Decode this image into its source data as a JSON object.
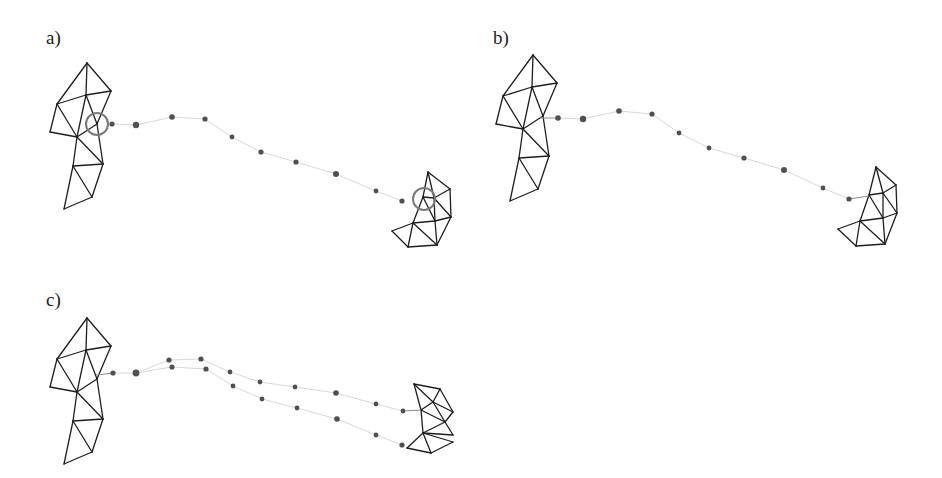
{
  "figure": {
    "panels": [
      {
        "id": "a",
        "label": "a)",
        "label_pos": [
          46,
          28
        ],
        "description": "Two triangle meshes with highlighted contact circles and a dotted trajectory between them",
        "left_mesh_offset": [
          0,
          0
        ],
        "right_mesh": {
          "vertices": [
            [
              428,
              172
            ],
            [
              450,
              189
            ],
            [
              423,
              197
            ],
            [
              434,
              198
            ],
            [
              451,
              217
            ],
            [
              435,
              221
            ],
            [
              413,
              223
            ],
            [
              392,
              231
            ],
            [
              408,
              247
            ],
            [
              437,
              245
            ]
          ],
          "edges": [
            [
              0,
              1
            ],
            [
              0,
              2
            ],
            [
              0,
              3
            ],
            [
              1,
              3
            ],
            [
              2,
              3
            ],
            [
              3,
              4
            ],
            [
              1,
              4
            ],
            [
              2,
              5
            ],
            [
              3,
              5
            ],
            [
              2,
              6
            ],
            [
              4,
              5
            ],
            [
              5,
              6
            ],
            [
              6,
              7
            ],
            [
              7,
              8
            ],
            [
              6,
              8
            ],
            [
              6,
              9
            ],
            [
              5,
              9
            ],
            [
              4,
              9
            ],
            [
              8,
              9
            ]
          ]
        },
        "dots": [
          [
            112,
            124
          ],
          [
            136,
            125
          ],
          [
            172,
            117
          ],
          [
            205,
            119
          ],
          [
            232,
            137
          ],
          [
            261,
            152
          ],
          [
            296,
            162
          ],
          [
            336,
            174
          ],
          [
            376,
            191
          ],
          [
            402,
            201
          ]
        ],
        "dot_radius": [
          2.6,
          3.2,
          2.8,
          2.6,
          2.4,
          2.6,
          2.6,
          3.0,
          2.4,
          2.6
        ],
        "highlight_circles": [
          [
            97,
            124,
            11
          ],
          [
            424,
            199,
            11
          ]
        ],
        "attach_lines": []
      },
      {
        "id": "b",
        "label": "b)",
        "label_pos": [
          493,
          28
        ],
        "description": "Meshes connected by a dotted trajectory with attachment segments",
        "left_mesh_offset": [
          446,
          -8
        ],
        "right_mesh": {
          "vertices": [
            [
              876,
              167
            ],
            [
              896,
              185
            ],
            [
              883,
              193
            ],
            [
              869,
              195
            ],
            [
              897,
              213
            ],
            [
              883,
              218
            ],
            [
              860,
              221
            ],
            [
              838,
              229
            ],
            [
              856,
              246
            ],
            [
              885,
              244
            ]
          ],
          "edges": [
            [
              0,
              1
            ],
            [
              0,
              3
            ],
            [
              0,
              2
            ],
            [
              1,
              2
            ],
            [
              3,
              2
            ],
            [
              2,
              4
            ],
            [
              1,
              4
            ],
            [
              3,
              5
            ],
            [
              2,
              5
            ],
            [
              3,
              6
            ],
            [
              4,
              5
            ],
            [
              5,
              6
            ],
            [
              6,
              7
            ],
            [
              7,
              8
            ],
            [
              6,
              8
            ],
            [
              6,
              9
            ],
            [
              5,
              9
            ],
            [
              4,
              9
            ],
            [
              8,
              9
            ]
          ]
        },
        "dots": [
          [
            558,
            118
          ],
          [
            583,
            119
          ],
          [
            619,
            111
          ],
          [
            652,
            114
          ],
          [
            679,
            133
          ],
          [
            709,
            148
          ],
          [
            744,
            158
          ],
          [
            784,
            170
          ],
          [
            823,
            188
          ],
          [
            849,
            199
          ]
        ],
        "dot_radius": [
          2.8,
          3.2,
          2.8,
          2.6,
          2.4,
          2.4,
          2.6,
          3.0,
          2.4,
          2.6
        ],
        "highlight_circles": [],
        "attach_lines": [
          [
            540,
            118,
            558,
            118
          ],
          [
            849,
            199,
            869,
            196
          ]
        ]
      },
      {
        "id": "c",
        "label": "c)",
        "label_pos": [
          46,
          290
        ],
        "description": "Meshes connected by a trajectory that splits into two branches",
        "left_mesh_offset": [
          0,
          255
        ],
        "right_mesh": {
          "vertices": [
            [
              414,
              384
            ],
            [
              440,
              389
            ],
            [
              453,
              412
            ],
            [
              433,
              402
            ],
            [
              421,
              410
            ],
            [
              445,
              422
            ],
            [
              423,
              433
            ],
            [
              453,
              435
            ],
            [
              453,
              442
            ],
            [
              407,
              448
            ],
            [
              431,
              453
            ]
          ],
          "edges": [
            [
              0,
              1
            ],
            [
              1,
              2
            ],
            [
              0,
              3
            ],
            [
              0,
              4
            ],
            [
              1,
              3
            ],
            [
              3,
              4
            ],
            [
              3,
              2
            ],
            [
              3,
              5
            ],
            [
              2,
              5
            ],
            [
              4,
              5
            ],
            [
              4,
              6
            ],
            [
              5,
              6
            ],
            [
              5,
              7
            ],
            [
              6,
              7
            ],
            [
              6,
              8
            ],
            [
              6,
              9
            ],
            [
              9,
              10
            ],
            [
              6,
              10
            ],
            [
              10,
              8
            ]
          ]
        },
        "dots": [
          [
            113,
            373
          ],
          [
            136,
            373
          ],
          [
            169,
            360
          ],
          [
            201,
            359
          ],
          [
            230,
            372
          ],
          [
            260,
            382
          ],
          [
            295,
            387
          ],
          [
            336,
            393
          ],
          [
            376,
            404
          ],
          [
            403,
            411
          ],
          [
            172,
            367
          ],
          [
            206,
            369
          ],
          [
            233,
            386
          ],
          [
            262,
            399
          ],
          [
            297,
            408
          ],
          [
            337,
            419
          ],
          [
            376,
            435
          ],
          [
            402,
            445
          ]
        ],
        "dot_radius": [
          2.6,
          3.4,
          2.6,
          2.6,
          2.4,
          2.4,
          2.4,
          2.8,
          2.4,
          2.4,
          2.6,
          2.6,
          2.4,
          2.4,
          2.4,
          2.8,
          2.4,
          2.6
        ],
        "highlight_circles": [],
        "attach_lines": [
          [
            96,
            375,
            113,
            373
          ],
          [
            403,
            411,
            421,
            410
          ]
        ]
      }
    ],
    "left_mesh_base": {
      "vertices": [
        [
          87,
          63
        ],
        [
          111,
          91
        ],
        [
          57,
          104
        ],
        [
          86,
          95
        ],
        [
          50,
          132
        ],
        [
          77,
          137
        ],
        [
          97,
          124
        ],
        [
          103,
          164
        ],
        [
          73,
          166
        ],
        [
          92,
          197
        ],
        [
          64,
          209
        ]
      ],
      "edges": [
        [
          0,
          1
        ],
        [
          0,
          2
        ],
        [
          0,
          3
        ],
        [
          3,
          1
        ],
        [
          3,
          2
        ],
        [
          2,
          4
        ],
        [
          2,
          5
        ],
        [
          3,
          5
        ],
        [
          3,
          6
        ],
        [
          1,
          6
        ],
        [
          4,
          5
        ],
        [
          5,
          6
        ],
        [
          6,
          7
        ],
        [
          5,
          7
        ],
        [
          5,
          8
        ],
        [
          8,
          7
        ],
        [
          8,
          9
        ],
        [
          7,
          9
        ],
        [
          8,
          10
        ],
        [
          9,
          10
        ]
      ]
    },
    "colors": {
      "mesh_stroke": "#1e1e1e",
      "dot_fill": "#505050",
      "highlight_circle": "#7a7a7a",
      "trajectory_line": "#d8d8d8",
      "background": "#ffffff"
    }
  }
}
